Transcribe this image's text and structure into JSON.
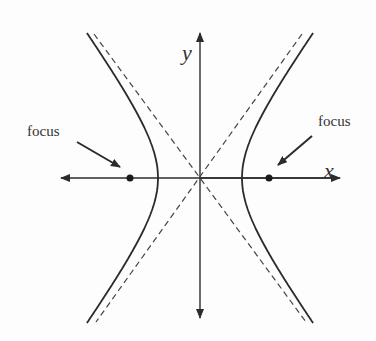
{
  "diagram": {
    "axes": {
      "x_label": "x",
      "y_label": "y"
    },
    "annotations": [
      {
        "id": "left-focus",
        "label": "focus"
      },
      {
        "id": "right-focus",
        "label": "focus"
      }
    ],
    "geometry": {
      "center": [
        200,
        178
      ],
      "a": 42,
      "b": 58,
      "foci_x": [
        130,
        270
      ],
      "stroke_color": "#2b2b2b",
      "asymptote_style": "dashed"
    }
  }
}
